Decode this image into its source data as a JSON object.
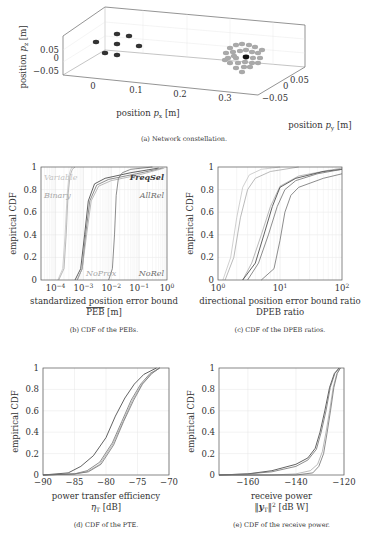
{
  "figure": {
    "subfigures": [
      {
        "id": "a",
        "caption": "(a) Network constellation."
      },
      {
        "id": "b",
        "caption": "(b) CDF of the PEBs."
      },
      {
        "id": "c",
        "caption": "(c) CDF of the DPEB ratios."
      },
      {
        "id": "d",
        "caption": "(d) CDF of the PTE."
      },
      {
        "id": "e",
        "caption": "(e) CDF of the receive power."
      }
    ]
  },
  "colors": {
    "dark": "#3a3a3a",
    "mid": "#707070",
    "light": "#a8a8a8",
    "lighter": "#c4c4c4",
    "grid": "#e6e6e6",
    "axis": "#555555"
  },
  "chart_data": [
    {
      "id": "a",
      "type": "scatter",
      "title": "Network constellation.",
      "xlabel": "position p_x [m]",
      "ylabel": "position p_y [m]",
      "zlabel": "position p_z [m]",
      "x_ticks": [
        "0",
        "0.1",
        "0.2",
        "0.3"
      ],
      "y_ticks": [
        "-0.05",
        "0",
        "0.05"
      ],
      "z_ticks": [
        "-0.05",
        "0",
        "0.05"
      ],
      "series": [
        {
          "name": "anchors (dark)",
          "points_xy_approx": [
            [
              0.0,
              0.04
            ],
            [
              0.02,
              0.0
            ],
            [
              0.05,
              0.03
            ],
            [
              0.05,
              0.0
            ],
            [
              0.08,
              0.03
            ],
            [
              0.1,
              0.0
            ],
            [
              0.05,
              -0.03
            ]
          ]
        },
        {
          "name": "agents (gray cluster)",
          "center_approx": [
            0.33,
            0.0,
            0.0
          ],
          "count_approx": 30
        },
        {
          "name": "reference (black)",
          "point_approx": [
            0.33,
            0.0,
            0.0
          ]
        }
      ]
    },
    {
      "id": "b",
      "type": "line",
      "title": "CDF of the PEBs.",
      "xlabel": "standardized position error bound",
      "xlabel2": "PEB [m]",
      "ylabel": "empirical CDF",
      "xscale": "log",
      "xlim": [
        3e-05,
        1
      ],
      "ylim": [
        0,
        1
      ],
      "x_ticks": [
        "10^-4",
        "10^-3",
        "10^-2",
        "10^-1",
        "10^0"
      ],
      "y_ticks": [
        "0",
        "0.2",
        "0.4",
        "0.6",
        "0.8",
        "1"
      ],
      "grid": true,
      "legend_labels": [
        "Variable",
        "Binary",
        "FreqSel",
        "AllRel",
        "NoProx",
        "NoRel"
      ],
      "series": [
        {
          "name": "Variable",
          "x": [
            0.00012,
            0.00018,
            0.00022,
            0.00026,
            0.0003,
            0.00035,
            0.0004
          ],
          "y": [
            0,
            0.1,
            0.4,
            0.75,
            0.92,
            0.98,
            1
          ]
        },
        {
          "name": "Binary",
          "x": [
            0.00013,
            0.0002,
            0.00024,
            0.00028,
            0.00033,
            0.0004,
            0.0005
          ],
          "y": [
            0,
            0.1,
            0.4,
            0.75,
            0.92,
            0.98,
            1
          ]
        },
        {
          "name": "FreqSel",
          "x": [
            0.0005,
            0.0008,
            0.0011,
            0.0015,
            0.0025,
            0.006,
            0.05,
            0.5
          ],
          "y": [
            0,
            0.1,
            0.4,
            0.7,
            0.85,
            0.9,
            0.95,
            0.99
          ]
        },
        {
          "name": "AllRel",
          "x": [
            0.0006,
            0.0009,
            0.0012,
            0.0017,
            0.003,
            0.008,
            0.08,
            0.7
          ],
          "y": [
            0,
            0.1,
            0.4,
            0.7,
            0.84,
            0.89,
            0.94,
            0.99
          ]
        },
        {
          "name": "NoProx",
          "x": [
            0.0006,
            0.0009,
            0.0013,
            0.0019,
            0.0035,
            0.01,
            0.1,
            0.8
          ],
          "y": [
            0,
            0.1,
            0.4,
            0.7,
            0.83,
            0.88,
            0.93,
            0.99
          ]
        },
        {
          "name": "NoRel",
          "x": [
            0.008,
            0.011,
            0.013,
            0.015,
            0.018,
            0.025,
            0.05,
            0.3
          ],
          "y": [
            0,
            0.1,
            0.4,
            0.75,
            0.9,
            0.95,
            0.98,
            1
          ]
        }
      ]
    },
    {
      "id": "c",
      "type": "line",
      "title": "CDF of the DPEB ratios.",
      "xlabel": "directional position error bound ratio",
      "xlabel2": "DPEB ratio",
      "ylabel": "empirical CDF",
      "xscale": "log",
      "xlim": [
        1,
        100
      ],
      "ylim": [
        0,
        1
      ],
      "x_ticks": [
        "10^0",
        "10^1",
        "10^2"
      ],
      "y_ticks": [
        "0",
        "0.2",
        "0.4",
        "0.6",
        "0.8",
        "1"
      ],
      "grid": true,
      "series": [
        {
          "name": "s1",
          "x": [
            1.2,
            1.6,
            2.0,
            2.5,
            3.2,
            5,
            10
          ],
          "y": [
            0,
            0.2,
            0.55,
            0.82,
            0.93,
            0.98,
            1
          ]
        },
        {
          "name": "s2",
          "x": [
            1.3,
            1.8,
            2.3,
            3.0,
            4.0,
            7,
            20
          ],
          "y": [
            0,
            0.2,
            0.55,
            0.8,
            0.9,
            0.96,
            1
          ]
        },
        {
          "name": "s3",
          "x": [
            2.5,
            3.5,
            5,
            7,
            10,
            20,
            60,
            100
          ],
          "y": [
            0,
            0.15,
            0.4,
            0.65,
            0.83,
            0.92,
            0.97,
            0.99
          ]
        },
        {
          "name": "s4",
          "x": [
            2.5,
            4,
            5.5,
            7.5,
            10,
            18,
            50,
            100
          ],
          "y": [
            0,
            0.15,
            0.4,
            0.65,
            0.82,
            0.9,
            0.96,
            0.98
          ]
        },
        {
          "name": "s5",
          "x": [
            3,
            4.5,
            6.5,
            9,
            12,
            18,
            40,
            100
          ],
          "y": [
            0,
            0.15,
            0.4,
            0.65,
            0.8,
            0.88,
            0.94,
            0.98
          ]
        },
        {
          "name": "s6",
          "x": [
            5,
            8,
            10,
            12,
            15,
            20,
            50,
            100
          ],
          "y": [
            0,
            0.1,
            0.35,
            0.6,
            0.75,
            0.82,
            0.9,
            0.94
          ]
        }
      ]
    },
    {
      "id": "d",
      "type": "line",
      "title": "CDF of the PTE.",
      "xlabel": "power transfer efficiency",
      "xlabel2": "η_T [dB]",
      "ylabel": "empirical CDF",
      "xlim": [
        -90,
        -70
      ],
      "ylim": [
        0,
        1
      ],
      "x_ticks": [
        "-90",
        "-85",
        "-80",
        "-75",
        "-70"
      ],
      "y_ticks": [
        "0",
        "0.2",
        "0.4",
        "0.6",
        "0.8",
        "1"
      ],
      "grid": true,
      "series": [
        {
          "name": "s1",
          "x": [
            -90,
            -86,
            -84,
            -82,
            -80,
            -78.5,
            -77,
            -75.5,
            -74,
            -72
          ],
          "y": [
            0,
            0.02,
            0.08,
            0.18,
            0.35,
            0.55,
            0.72,
            0.85,
            0.94,
            1
          ]
        },
        {
          "name": "s2",
          "x": [
            -90,
            -85,
            -83,
            -81,
            -79,
            -77.5,
            -76,
            -74.5,
            -73,
            -71.5
          ],
          "y": [
            0,
            0.01,
            0.04,
            0.12,
            0.3,
            0.5,
            0.7,
            0.85,
            0.95,
            1
          ]
        },
        {
          "name": "s3",
          "x": [
            -90,
            -85,
            -83,
            -81,
            -79,
            -77.3,
            -75.8,
            -74.3,
            -72.8,
            -71.5
          ],
          "y": [
            0,
            0.01,
            0.03,
            0.1,
            0.28,
            0.5,
            0.7,
            0.85,
            0.95,
            1
          ]
        },
        {
          "name": "s4",
          "x": [
            -90,
            -85,
            -82.8,
            -80.8,
            -78.8,
            -77.2,
            -75.6,
            -74.2,
            -72.7,
            -71.5
          ],
          "y": [
            0,
            0.01,
            0.03,
            0.1,
            0.28,
            0.5,
            0.7,
            0.85,
            0.95,
            1
          ]
        }
      ]
    },
    {
      "id": "e",
      "type": "line",
      "title": "CDF of the receive power.",
      "xlabel": "receive power",
      "xlabel2": "||y_T||^2 [dB W]",
      "ylabel": "empirical CDF",
      "xlim": [
        -172,
        -120
      ],
      "ylim": [
        0,
        1
      ],
      "x_ticks": [
        "-160",
        "-140",
        "-120"
      ],
      "y_ticks": [
        "0",
        "0.2",
        "0.4",
        "0.6",
        "0.8",
        "1"
      ],
      "grid": true,
      "series": [
        {
          "name": "s1",
          "x": [
            -172,
            -160,
            -150,
            -140,
            -135,
            -132,
            -130,
            -128,
            -126,
            -124,
            -122
          ],
          "y": [
            0,
            0.01,
            0.04,
            0.1,
            0.16,
            0.25,
            0.4,
            0.6,
            0.82,
            0.95,
            1
          ]
        },
        {
          "name": "s2",
          "x": [
            -172,
            -160,
            -150,
            -140,
            -135,
            -131.5,
            -129.5,
            -127.5,
            -125.7,
            -123.8,
            -122
          ],
          "y": [
            0,
            0.01,
            0.03,
            0.08,
            0.14,
            0.24,
            0.4,
            0.6,
            0.82,
            0.95,
            1
          ]
        },
        {
          "name": "s3",
          "x": [
            -172,
            -150,
            -140,
            -134,
            -131,
            -129,
            -127.5,
            -126,
            -124.5,
            -123,
            -121.5
          ],
          "y": [
            0,
            0.0,
            0.01,
            0.04,
            0.1,
            0.22,
            0.4,
            0.6,
            0.82,
            0.95,
            1
          ]
        },
        {
          "name": "s4",
          "x": [
            -172,
            -150,
            -140,
            -133,
            -130.5,
            -128.5,
            -127,
            -125.6,
            -124.2,
            -122.8,
            -121.5
          ],
          "y": [
            0,
            0.0,
            0.0,
            0.02,
            0.08,
            0.2,
            0.4,
            0.6,
            0.82,
            0.95,
            1
          ]
        }
      ]
    }
  ],
  "labels": {
    "a_zlabel": "position p_z [m]",
    "a_xlabel": "position p_x [m]",
    "a_ylabel": "position p_y [m]"
  }
}
